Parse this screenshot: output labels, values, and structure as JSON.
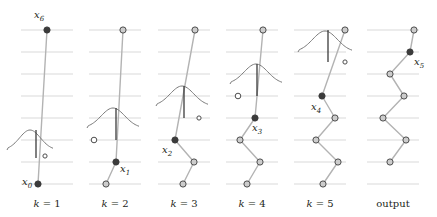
{
  "figure": {
    "type": "diagram",
    "background": "#ffffff",
    "width": 437,
    "height": 217,
    "style": {
      "gridline_color": "#d9d9d9",
      "edge_color": "#b3b3b3",
      "node_stroke": "#4d4d4d",
      "node_open_fill": "#cccccc",
      "node_filled_fill": "#3b3b3b",
      "curve_color": "#7a7a7a",
      "tick_color": "#3b3b3b",
      "text_color": "#231f20"
    },
    "grid": {
      "rows": 8,
      "y_values": [
        30,
        52,
        74,
        96,
        118,
        140,
        162,
        184
      ],
      "row_spacing": 22,
      "line_left_offset": -26,
      "line_right_offset": 26
    },
    "panels": [
      {
        "id": "panel-k1",
        "label": "k = 1",
        "label_x": 47,
        "center_x": 47,
        "nodes": [
          {
            "name": "x6",
            "x": 47,
            "y": 30,
            "style": "filled",
            "label": "x_6",
            "label_dx": -13,
            "label_dy": -12
          },
          {
            "name": "x0",
            "x": 38,
            "y": 184,
            "style": "filled",
            "label": "x_0",
            "label_dx": -16,
            "label_dy": 1
          }
        ],
        "edges": [
          [
            0,
            1
          ]
        ],
        "kernel": {
          "cx": 30,
          "cy": 150,
          "width": 46,
          "height": 20,
          "tick_x": 36,
          "tick_top": 130,
          "tick_bottom": 158
        },
        "proposal": {
          "x": 45,
          "y": 156,
          "style": "hollow-small"
        }
      },
      {
        "id": "panel-k2",
        "label": "k = 2",
        "label_x": 115,
        "center_x": 115,
        "nodes": [
          {
            "name": "top",
            "x": 123,
            "y": 30,
            "style": "open"
          },
          {
            "name": "x1",
            "x": 116,
            "y": 162,
            "style": "filled",
            "label": "x_1",
            "label_dx": 4,
            "label_dy": 10
          },
          {
            "name": "x0",
            "x": 106,
            "y": 184,
            "style": "open"
          }
        ],
        "edges": [
          [
            0,
            1
          ],
          [
            1,
            2
          ]
        ],
        "kernel": {
          "cx": 113,
          "cy": 128,
          "width": 52,
          "height": 20,
          "tick_x": 116,
          "tick_top": 108,
          "tick_bottom": 140
        },
        "proposal": {
          "x": 94,
          "y": 140,
          "style": "hollow"
        }
      },
      {
        "id": "panel-k3",
        "label": "k = 3",
        "label_x": 184,
        "center_x": 184,
        "nodes": [
          {
            "name": "top",
            "x": 195,
            "y": 30,
            "style": "open"
          },
          {
            "name": "x2",
            "x": 175,
            "y": 140,
            "style": "filled",
            "label": "x_2",
            "label_dx": -13,
            "label_dy": 13
          },
          {
            "name": "n1",
            "x": 194,
            "y": 162,
            "style": "open"
          },
          {
            "name": "n0",
            "x": 183,
            "y": 184,
            "style": "open"
          }
        ],
        "edges": [
          [
            0,
            1
          ],
          [
            1,
            2
          ],
          [
            2,
            3
          ]
        ],
        "kernel": {
          "cx": 182,
          "cy": 106,
          "width": 52,
          "height": 20,
          "tick_x": 184,
          "tick_top": 86,
          "tick_bottom": 118
        },
        "proposal": {
          "x": 199,
          "y": 118,
          "style": "hollow-small"
        }
      },
      {
        "id": "panel-k4",
        "label": "k = 4",
        "label_x": 252,
        "center_x": 252,
        "nodes": [
          {
            "name": "top",
            "x": 263,
            "y": 30,
            "style": "open"
          },
          {
            "name": "x3",
            "x": 255,
            "y": 118,
            "style": "filled",
            "label": "x_3",
            "label_dx": -3,
            "label_dy": 13
          },
          {
            "name": "n2",
            "x": 240,
            "y": 140,
            "style": "open"
          },
          {
            "name": "n1",
            "x": 260,
            "y": 162,
            "style": "open"
          },
          {
            "name": "n0",
            "x": 247,
            "y": 184,
            "style": "open"
          }
        ],
        "edges": [
          [
            0,
            1
          ],
          [
            1,
            2
          ],
          [
            2,
            3
          ],
          [
            3,
            4
          ]
        ],
        "kernel": {
          "cx": 256,
          "cy": 84,
          "width": 52,
          "height": 20,
          "tick_x": 257,
          "tick_top": 64,
          "tick_bottom": 96
        },
        "proposal": {
          "x": 238,
          "y": 96,
          "style": "hollow"
        }
      },
      {
        "id": "panel-k5",
        "label": "k = 5",
        "label_x": 320,
        "center_x": 320,
        "nodes": [
          {
            "name": "top",
            "x": 345,
            "y": 30,
            "style": "open"
          },
          {
            "name": "x4",
            "x": 322,
            "y": 96,
            "style": "filled",
            "label": "x_4",
            "label_dx": -11,
            "label_dy": 14
          },
          {
            "name": "n3",
            "x": 335,
            "y": 118,
            "style": "open"
          },
          {
            "name": "n2",
            "x": 316,
            "y": 140,
            "style": "open"
          },
          {
            "name": "n1",
            "x": 338,
            "y": 162,
            "style": "open"
          },
          {
            "name": "n0",
            "x": 323,
            "y": 184,
            "style": "open"
          }
        ],
        "edges": [
          [
            0,
            1
          ],
          [
            1,
            2
          ],
          [
            2,
            3
          ],
          [
            3,
            4
          ],
          [
            4,
            5
          ]
        ],
        "kernel": {
          "cx": 325,
          "cy": 52,
          "width": 54,
          "height": 21,
          "tick_x": 328,
          "tick_top": 30,
          "tick_bottom": 62
        },
        "proposal": {
          "x": 345,
          "y": 62,
          "style": "hollow-small"
        }
      },
      {
        "id": "panel-output",
        "label": "output",
        "label_x": 393,
        "center_x": 393,
        "nodes": [
          {
            "name": "top",
            "x": 414,
            "y": 30,
            "style": "open"
          },
          {
            "name": "x5",
            "x": 410,
            "y": 52,
            "style": "filled",
            "label": "x_5",
            "label_dx": 4,
            "label_dy": 13
          },
          {
            "name": "n4",
            "x": 390,
            "y": 74,
            "style": "open"
          },
          {
            "name": "n3",
            "x": 404,
            "y": 96,
            "style": "open"
          },
          {
            "name": "n2",
            "x": 383,
            "y": 118,
            "style": "open"
          },
          {
            "name": "n1",
            "x": 406,
            "y": 140,
            "style": "open"
          },
          {
            "name": "n0",
            "x": 390,
            "y": 162,
            "style": "open"
          }
        ],
        "edges": [
          [
            0,
            1
          ],
          [
            1,
            2
          ],
          [
            2,
            3
          ],
          [
            3,
            4
          ],
          [
            4,
            5
          ],
          [
            5,
            6
          ]
        ],
        "kernel": null,
        "proposal": null
      }
    ]
  }
}
